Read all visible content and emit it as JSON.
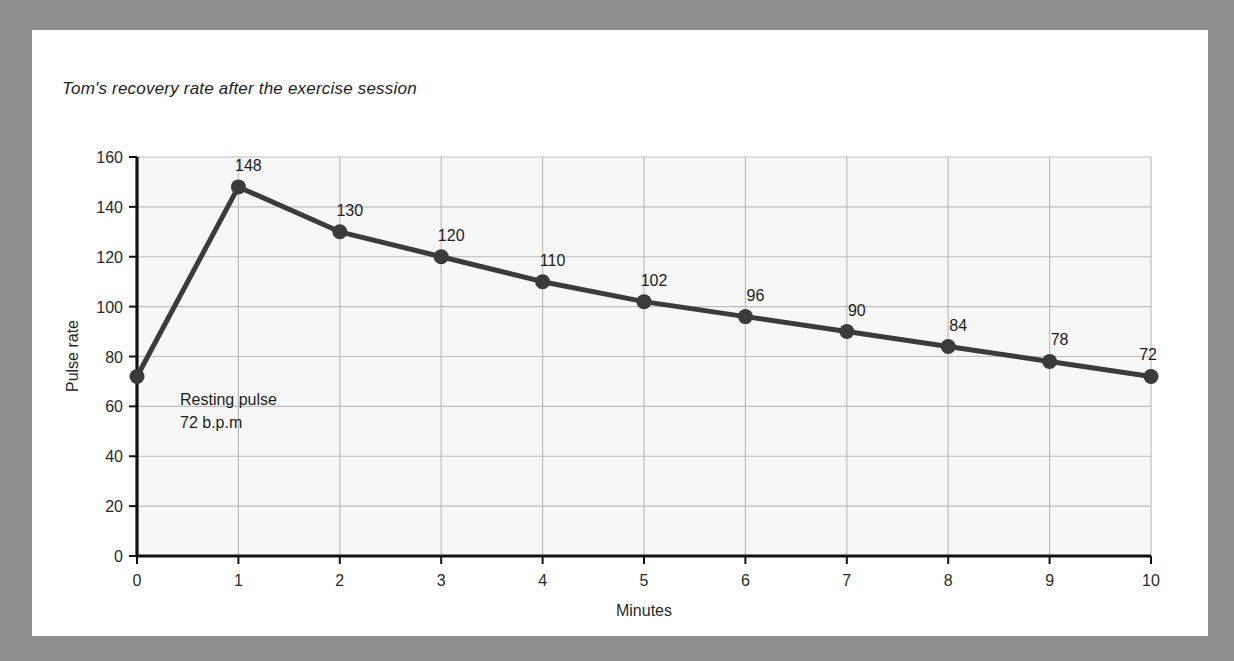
{
  "page": {
    "background_color": "#8f8f8f",
    "sheet_color": "#ffffff"
  },
  "chart_data": {
    "type": "line",
    "title": "Tom's recovery rate after the exercise session",
    "xlabel": "Minutes",
    "ylabel": "Pulse rate",
    "x": [
      0,
      1,
      2,
      3,
      4,
      5,
      6,
      7,
      8,
      9,
      10
    ],
    "values": [
      72,
      148,
      130,
      120,
      110,
      102,
      96,
      90,
      84,
      78,
      72
    ],
    "point_labels": [
      "",
      "148",
      "130",
      "120",
      "110",
      "102",
      "96",
      "90",
      "84",
      "78",
      "72"
    ],
    "xlim": [
      0,
      10
    ],
    "ylim": [
      0,
      160
    ],
    "xticks": [
      "0",
      "1",
      "2",
      "3",
      "4",
      "5",
      "6",
      "7",
      "8",
      "9",
      "10"
    ],
    "yticks": [
      "0",
      "20",
      "40",
      "60",
      "80",
      "100",
      "120",
      "140",
      "160"
    ],
    "grid": true,
    "legend": null,
    "annotations": [
      {
        "line1": "Resting pulse",
        "line2": "72 b.p.m",
        "at_x": 0,
        "at_y": 72
      }
    ],
    "series_color": "#3b3b3b",
    "grid_color": "#bdbdbd",
    "plot_background": "#f7f7f7"
  }
}
